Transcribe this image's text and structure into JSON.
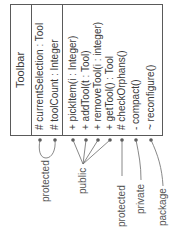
{
  "class": {
    "name": "Toolbar",
    "attributes": [
      {
        "visibility": "#",
        "text": "currentSelection : Tool"
      },
      {
        "visibility": "#",
        "text": "toolCount : Integer"
      }
    ],
    "operations": [
      {
        "visibility": "+",
        "text": "pickItem(i : Integer)"
      },
      {
        "visibility": "+",
        "text": "addTool(t : Tool)"
      },
      {
        "visibility": "+",
        "text": "removeTool(i : integer)"
      },
      {
        "visibility": "+",
        "text": "getTool() : Tool"
      },
      {
        "visibility": "#",
        "text": "checkOrphans()"
      },
      {
        "visibility": "-",
        "text": "compact()"
      },
      {
        "visibility": "~",
        "text": "reconfigure()"
      }
    ]
  },
  "annotations": [
    {
      "label": "protected"
    },
    {
      "label": "public"
    },
    {
      "label": "protected"
    },
    {
      "label": "private"
    },
    {
      "label": "package"
    }
  ],
  "colors": {
    "line": "#5a5a5a",
    "text": "#3a3a3a"
  }
}
